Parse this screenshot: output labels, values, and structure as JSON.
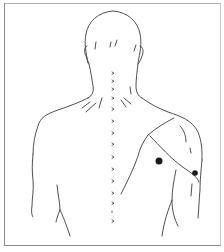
{
  "figure": {
    "description": "Line drawing of a human figure seen from behind showing head, neck, shoulders and upper back with spinal markers and an outlined region over the right shoulder/upper arm with two marked points",
    "view": "posterior",
    "line_color": "#3a3a3a",
    "frame_color": "#8a8a8a",
    "spine_markers": {
      "count": 15,
      "glyph": "›",
      "x": 113
    },
    "points": [
      {
        "label": "point-1",
        "x": 159,
        "y": 161,
        "r": 3.5,
        "color": "#1a1a1a"
      },
      {
        "label": "point-2",
        "x": 195,
        "y": 173,
        "r": 2.8,
        "color": "#1a1a1a"
      }
    ],
    "highlighted_region": "right-shoulder-posterior-deltoid"
  }
}
